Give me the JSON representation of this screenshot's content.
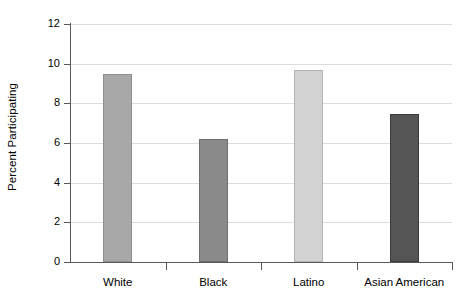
{
  "chart_data": {
    "type": "bar",
    "title": "",
    "subtitle": "",
    "xlabel": "",
    "ylabel": "Percent Participating",
    "categories": [
      "White",
      "Black",
      "Latino",
      "Asian American"
    ],
    "values": [
      9.5,
      6.2,
      9.7,
      7.45
    ],
    "series": [
      {
        "name": "Percent Participating",
        "values": [
          9.5,
          6.2,
          9.7,
          7.45
        ]
      }
    ],
    "bar_colors": [
      "#a8a8a8",
      "#8a8a8a",
      "#d2d2d2",
      "#555555"
    ],
    "bar_edge_colors": [
      "#8f8f8f",
      "#6f6f6f",
      "#b4b4b4",
      "#3c3c3c"
    ],
    "ylim": [
      0,
      12
    ],
    "xlim_categories": 4,
    "ytick_labels": [
      "0",
      "2",
      "4",
      "6",
      "8",
      "10",
      "12"
    ],
    "ytick_values": [
      0,
      2,
      4,
      6,
      8,
      10,
      12
    ],
    "grid": "horizontal",
    "grid_color": "#dcdcdc",
    "axis_color": "#595959",
    "background_color": "#ffffff",
    "legend": "none",
    "annotations": []
  },
  "axes": {
    "y_title": "Percent Participating"
  }
}
